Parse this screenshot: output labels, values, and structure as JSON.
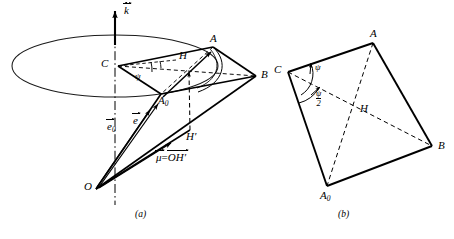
{
  "figure": {
    "panels": [
      {
        "id": "a",
        "caption": "(a)",
        "description": "three-dimensional precession diagram",
        "labels": {
          "omega_vector": "k",
          "omega_vector_accent": "psi-dot",
          "apex": "O",
          "center": "C",
          "point_a": "A",
          "point_b": "B",
          "point_h": "H",
          "point_a0": "A",
          "point_a0_sub": "0",
          "point_hprime": "H′",
          "angle_psi": "ψ",
          "vector_e0": "e",
          "vector_e0_sub": "0",
          "vector_e": "e",
          "mu_label": "μ",
          "mu_equals": "=",
          "mu_value": "OH′"
        }
      },
      {
        "id": "b",
        "caption": "(b)",
        "description": "planar quadrilateral with diagonals",
        "labels": {
          "point_c": "C",
          "point_a": "A",
          "point_b": "B",
          "point_h": "H",
          "point_a0": "A",
          "point_a0_sub": "0",
          "angle_psi": "ψ",
          "angle_psi_half_num": "ψ",
          "angle_psi_half_den": "2"
        }
      }
    ],
    "colors": {
      "stroke": "#000000",
      "background": "#ffffff",
      "ellipse_stroke": "#1a1a1a"
    },
    "geometry": {
      "panel_a": {
        "ellipse_center": [
          115,
          66
        ],
        "ellipse_rx": 103,
        "ellipse_ry": 31,
        "axis_top": [
          115,
          18
        ],
        "axis_bottom": [
          115,
          205
        ],
        "C": [
          118,
          66
        ],
        "A": [
          213,
          47
        ],
        "B": [
          256,
          76
        ],
        "H": [
          186,
          64
        ],
        "A0": [
          161,
          94
        ],
        "Hprime": [
          190,
          130
        ],
        "O": [
          96,
          189
        ]
      },
      "panel_b": {
        "C": [
          288,
          72
        ],
        "A": [
          373,
          43
        ],
        "B": [
          432,
          146
        ],
        "A0": [
          327,
          186
        ],
        "H": [
          360,
          110
        ]
      }
    }
  }
}
